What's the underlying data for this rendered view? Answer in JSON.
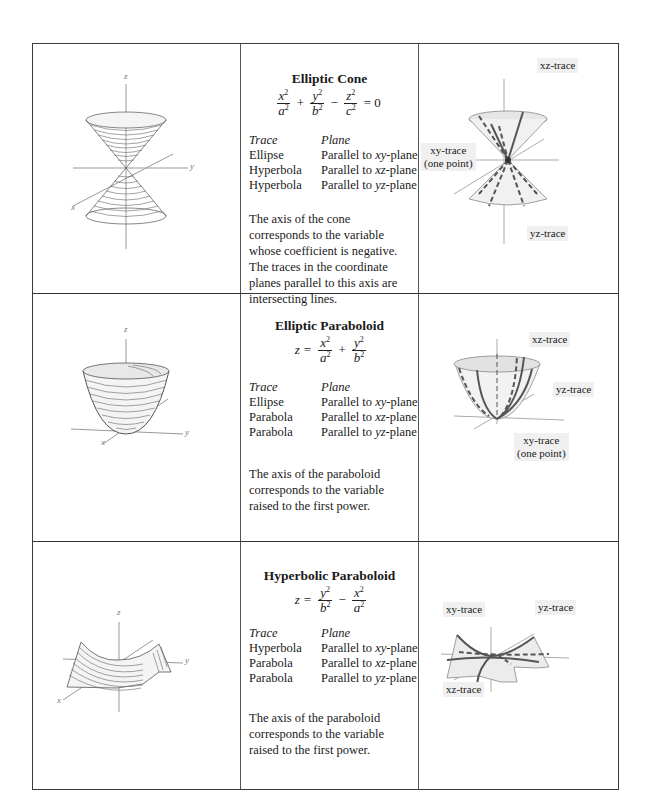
{
  "rows": [
    {
      "title": "Elliptic Cone",
      "equation_text": "x^2/a^2 + y^2/b^2 - z^2/c^2 = 0",
      "equation": {
        "lhs": "",
        "terms": [
          {
            "num_var": "x",
            "den_var": "a",
            "op_before": ""
          },
          {
            "num_var": "y",
            "den_var": "b",
            "op_before": "+"
          },
          {
            "num_var": "z",
            "den_var": "c",
            "op_before": "−"
          }
        ],
        "rhs": "= 0"
      },
      "trace_header": {
        "trace": "Trace",
        "plane": "Plane"
      },
      "traces": [
        {
          "trace": "Ellipse",
          "plane_prefix": "Parallel to ",
          "plane_var": "xy",
          "plane_suffix": "-plane"
        },
        {
          "trace": "Hyperbola",
          "plane_prefix": "Parallel to ",
          "plane_var": "xz",
          "plane_suffix": "-plane"
        },
        {
          "trace": "Hyperbola",
          "plane_prefix": "Parallel to ",
          "plane_var": "yz",
          "plane_suffix": "-plane"
        }
      ],
      "description": "The axis of the cone corresponds to the variable whose coefficient is negative. The traces in the coordinate planes parallel to this axis are intersecting lines.",
      "surface_axes": {
        "x": "x",
        "y": "y",
        "z": "z"
      },
      "trace_labels": {
        "xz": "xz-trace",
        "xy_line1": "xy-trace",
        "xy_line2": "(one point)",
        "yz": "yz-trace"
      }
    },
    {
      "title": "Elliptic Paraboloid",
      "equation_text": "z = x^2/a^2 + y^2/b^2",
      "equation": {
        "lhs": "z =",
        "terms": [
          {
            "num_var": "x",
            "den_var": "a",
            "op_before": ""
          },
          {
            "num_var": "y",
            "den_var": "b",
            "op_before": "+"
          }
        ],
        "rhs": ""
      },
      "trace_header": {
        "trace": "Trace",
        "plane": "Plane"
      },
      "traces": [
        {
          "trace": "Ellipse",
          "plane_prefix": "Parallel to ",
          "plane_var": "xy",
          "plane_suffix": "-plane"
        },
        {
          "trace": "Parabola",
          "plane_prefix": "Parallel to ",
          "plane_var": "xz",
          "plane_suffix": "-plane"
        },
        {
          "trace": "Parabola",
          "plane_prefix": "Parallel to ",
          "plane_var": "yz",
          "plane_suffix": "-plane"
        }
      ],
      "description": "The axis of the paraboloid corresponds to the variable raised to the first power.",
      "surface_axes": {
        "x": "x",
        "y": "y",
        "z": "z"
      },
      "trace_labels": {
        "xz": "xz-trace",
        "yz": "yz-trace",
        "xy_line1": "xy-trace",
        "xy_line2": "(one point)"
      }
    },
    {
      "title": "Hyperbolic Paraboloid",
      "equation_text": "z = y^2/b^2 - x^2/a^2",
      "equation": {
        "lhs": "z =",
        "terms": [
          {
            "num_var": "y",
            "den_var": "b",
            "op_before": ""
          },
          {
            "num_var": "x",
            "den_var": "a",
            "op_before": "−"
          }
        ],
        "rhs": ""
      },
      "trace_header": {
        "trace": "Trace",
        "plane": "Plane"
      },
      "traces": [
        {
          "trace": "Hyperbola",
          "plane_prefix": "Parallel to ",
          "plane_var": "xy",
          "plane_suffix": "-plane"
        },
        {
          "trace": "Parabola",
          "plane_prefix": "Parallel to ",
          "plane_var": "xz",
          "plane_suffix": "-plane"
        },
        {
          "trace": "Parabola",
          "plane_prefix": "Parallel to ",
          "plane_var": "yz",
          "plane_suffix": "-plane"
        }
      ],
      "description": "The axis of the paraboloid corresponds to the variable raised to the first power.",
      "surface_axes": {
        "x": "x",
        "y": "y",
        "z": "z"
      },
      "trace_labels": {
        "xy": "xy-trace",
        "yz": "yz-trace",
        "xz": "xz-trace"
      }
    }
  ],
  "sup_two": "2"
}
